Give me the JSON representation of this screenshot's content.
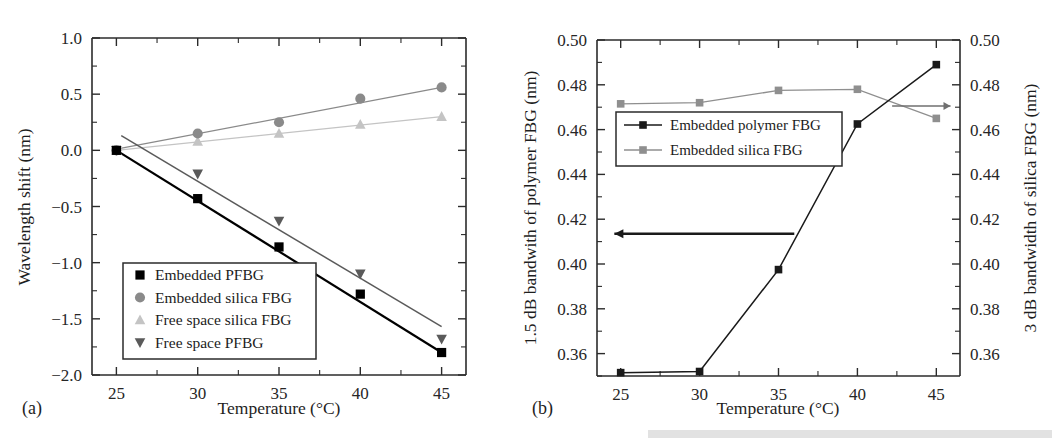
{
  "figure": {
    "panel_a_label": "(a)",
    "panel_b_label": "(b)",
    "background": "#ffffff"
  },
  "chart_data": [
    {
      "id": "panel-a",
      "type": "scatter",
      "title": "",
      "panel": "(a)",
      "xlabel": "Temperature (°C)",
      "ylabel": "Wavelength shift (nm)",
      "xlim": [
        23.5,
        46.5
      ],
      "ylim": [
        -2.0,
        1.0
      ],
      "xticks": [
        25,
        30,
        35,
        40,
        45
      ],
      "xticklabels": [
        "25",
        "30",
        "35",
        "40",
        "45"
      ],
      "yticks": [
        -2.0,
        -1.5,
        -1.0,
        -0.5,
        0.0,
        0.5,
        1.0
      ],
      "yticklabels": [
        "-2.0",
        "-1.5",
        "-1.0",
        "-0.5",
        "0.0",
        "0.5",
        "1.0"
      ],
      "grid": false,
      "legend_position": "lower-left",
      "x": [
        25,
        30,
        35,
        40,
        45
      ],
      "series": [
        {
          "name": "Embedded PFBG",
          "marker": "square",
          "color": "#000000",
          "line": true,
          "linewidth": 2.2,
          "values": [
            0.0,
            -0.43,
            -0.86,
            -1.28,
            -1.8
          ],
          "fit": {
            "x": [
              25,
              45
            ],
            "y": [
              0.0,
              -1.8
            ]
          }
        },
        {
          "name": "Embedded silica FBG",
          "marker": "circle",
          "color": "#8a8a8a",
          "line": true,
          "linewidth": 1.3,
          "values": [
            0.0,
            0.15,
            0.25,
            0.46,
            0.56
          ],
          "fit": {
            "x": [
              25,
              45
            ],
            "y": [
              0.01,
              0.56
            ]
          }
        },
        {
          "name": "Free space silica FBG",
          "marker": "triangle-up",
          "color": "#c4c4c4",
          "line": true,
          "linewidth": 1.2,
          "values": [
            0.0,
            0.08,
            0.15,
            0.23,
            0.3
          ],
          "fit": {
            "x": [
              25,
              45
            ],
            "y": [
              0.0,
              0.3
            ]
          }
        },
        {
          "name": "Free space PFBG",
          "marker": "triangle-down",
          "color": "#5a5a5a",
          "line": true,
          "linewidth": 1.5,
          "values": [
            0.0,
            -0.21,
            -0.63,
            -1.1,
            -1.68
          ],
          "fit": {
            "x": [
              25.3,
              45
            ],
            "y": [
              0.13,
              -1.57
            ]
          }
        }
      ]
    },
    {
      "id": "panel-b",
      "type": "line",
      "title": "",
      "panel": "(b)",
      "xlabel": "Temperature (°C)",
      "ylabel_left": "1.5 dB bandwith of polymer FBG (nm)",
      "ylabel_right": "3 dB bandwidth of silica FBG (nm)",
      "xlim": [
        23.5,
        46.5
      ],
      "ylim_left": [
        0.35,
        0.5
      ],
      "ylim_right": [
        0.35,
        0.5
      ],
      "xticks": [
        25,
        30,
        35,
        40,
        45
      ],
      "xticklabels": [
        "25",
        "30",
        "35",
        "40",
        "45"
      ],
      "yticks": [
        0.36,
        0.38,
        0.4,
        0.42,
        0.44,
        0.46,
        0.48,
        0.5
      ],
      "yticklabels": [
        "0.36",
        "0.38",
        "0.40",
        "0.42",
        "0.44",
        "0.46",
        "0.48",
        "0.50"
      ],
      "yticklabels_right": [
        "0.36",
        "0.38",
        "0.40",
        "0.42",
        "0.44",
        "0.46",
        "0.48",
        "0.50"
      ],
      "grid": false,
      "legend_position": "upper-left",
      "x": [
        25,
        30,
        35,
        40,
        45
      ],
      "series": [
        {
          "name": "Embedded polymer FBG",
          "axis": "left",
          "marker": "square",
          "color": "#1a1a1a",
          "linewidth": 1.5,
          "values": [
            0.3515,
            0.352,
            0.3975,
            0.4625,
            0.489
          ]
        },
        {
          "name": "Embedded silica FBG",
          "axis": "right",
          "marker": "square",
          "color": "#8f8f8f",
          "linewidth": 1.3,
          "values": [
            0.4715,
            0.472,
            0.4775,
            0.478,
            0.465
          ]
        }
      ],
      "annotations": [
        {
          "name": "left-arrow-to-polymer-axis",
          "type": "arrow",
          "direction": "left",
          "y_value": 0.4135,
          "x_start": 36.0,
          "x_end": 24.6
        },
        {
          "name": "right-arrow-to-silica-axis",
          "type": "arrow",
          "direction": "right",
          "y_value": 0.4705,
          "x_start": 42.2,
          "x_end": 45.9,
          "axis": "right"
        }
      ]
    }
  ],
  "legends": {
    "panel_a": [
      {
        "label": "Embedded PFBG",
        "marker": "square",
        "color": "#000000"
      },
      {
        "label": "Embedded silica FBG",
        "marker": "circle",
        "color": "#8a8a8a"
      },
      {
        "label": "Free space silica FBG",
        "marker": "triangle-up",
        "color": "#c4c4c4"
      },
      {
        "label": "Free space PFBG",
        "marker": "triangle-down",
        "color": "#5a5a5a"
      }
    ],
    "panel_b": [
      {
        "label": "Embedded polymer FBG",
        "marker": "square",
        "color": "#1a1a1a"
      },
      {
        "label": "Embedded silica FBG",
        "marker": "square",
        "color": "#8f8f8f"
      }
    ]
  }
}
